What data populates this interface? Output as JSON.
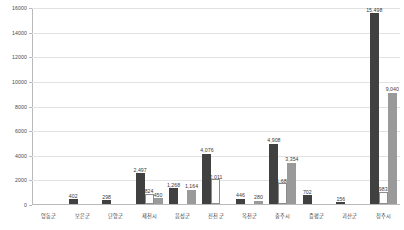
{
  "chart_data": {
    "type": "bar",
    "title": "",
    "xlabel": "",
    "ylabel": "",
    "ylim": [
      0,
      16000
    ],
    "ytick_step": 2000,
    "yticks": [
      "0",
      "2000",
      "4000",
      "6000",
      "8000",
      "10000",
      "12000",
      "14000",
      "16000"
    ],
    "grid": true,
    "legend": "none",
    "categories": [
      "영동군",
      "보은군",
      "단양군",
      "제천시",
      "음성군",
      "진천군",
      "옥천군",
      "충주시",
      "증평군",
      "괴산군",
      "청주시"
    ],
    "series": [
      {
        "name": "series-1",
        "color": "#404040",
        "values": [
          null,
          402,
          298,
          2497,
          1268,
          4076,
          446,
          4908,
          702,
          156,
          15498
        ],
        "labels": [
          "",
          "402",
          "298",
          "2,497",
          "1,268",
          "4,076",
          "446",
          "4,908",
          "702",
          "156",
          "15,498"
        ]
      },
      {
        "name": "series-2",
        "color": "#fdfdfd",
        "values": [
          null,
          null,
          null,
          824,
          null,
          2011,
          null,
          1688,
          null,
          null,
          983
        ],
        "labels": [
          "",
          "",
          "",
          "824",
          "",
          "2,011",
          "",
          "1,688",
          "",
          "",
          "983"
        ]
      },
      {
        "name": "series-3",
        "color": "#9a9a9a",
        "values": [
          null,
          null,
          null,
          450,
          1164,
          null,
          280,
          3354,
          null,
          null,
          9040
        ],
        "labels": [
          "",
          "",
          "",
          "450",
          "1,164",
          "",
          "280",
          "3,354",
          "",
          "",
          "9,040"
        ]
      }
    ]
  }
}
